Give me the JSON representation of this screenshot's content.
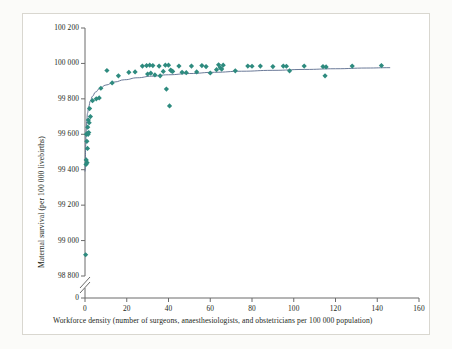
{
  "figure": {
    "background_color": "#fbfbf9",
    "frame_color": "#d9d7d0",
    "plot_background": "#ffffff"
  },
  "chart_data": {
    "type": "scatter",
    "title": "",
    "xlabel": "Workforce density (number of surgeons, anaesthesiologists, and obstetricians per 100 000 population)",
    "ylabel": "Maternal survival (per 100 000 livebirths)",
    "marker_color": "#2e8b7f",
    "curve_color": "#5a6b8c",
    "axis_color": "#6b6b6b",
    "grid": false,
    "legend": null,
    "xlim": [
      0,
      160
    ],
    "ylim": [
      98800,
      100200
    ],
    "y_axis_break": true,
    "y_break_label": "0",
    "xticks": [
      0,
      20,
      40,
      60,
      80,
      100,
      120,
      140,
      160
    ],
    "xticklabels": [
      "0",
      "20",
      "40",
      "60",
      "80",
      "100",
      "120",
      "140",
      "160"
    ],
    "yticks": [
      98800,
      99000,
      99200,
      99400,
      99600,
      99800,
      100000,
      100200
    ],
    "yticklabels": [
      "98 800",
      "99 000",
      "99 200",
      "99 400",
      "99 600",
      "99 800",
      "100 000",
      "100 200"
    ],
    "points": [
      {
        "x": 0.3,
        "y": 98920
      },
      {
        "x": 0.5,
        "y": 99430
      },
      {
        "x": 0.6,
        "y": 99455
      },
      {
        "x": 1.0,
        "y": 99440
      },
      {
        "x": 1.2,
        "y": 99520
      },
      {
        "x": 0.9,
        "y": 99560
      },
      {
        "x": 0.7,
        "y": 99600
      },
      {
        "x": 1.1,
        "y": 99605
      },
      {
        "x": 1.5,
        "y": 99600
      },
      {
        "x": 1.8,
        "y": 99610
      },
      {
        "x": 1.3,
        "y": 99640
      },
      {
        "x": 2.0,
        "y": 99665
      },
      {
        "x": 1.6,
        "y": 99680
      },
      {
        "x": 2.6,
        "y": 99700
      },
      {
        "x": 2.2,
        "y": 99745
      },
      {
        "x": 3.6,
        "y": 99790
      },
      {
        "x": 5.4,
        "y": 99800
      },
      {
        "x": 6.8,
        "y": 99805
      },
      {
        "x": 7.6,
        "y": 99860
      },
      {
        "x": 10.5,
        "y": 99960
      },
      {
        "x": 13.0,
        "y": 99890
      },
      {
        "x": 16.0,
        "y": 99930
      },
      {
        "x": 21.0,
        "y": 99950
      },
      {
        "x": 24.0,
        "y": 99952
      },
      {
        "x": 27.5,
        "y": 99985
      },
      {
        "x": 29.5,
        "y": 99988
      },
      {
        "x": 31.0,
        "y": 99990
      },
      {
        "x": 32.5,
        "y": 99988
      },
      {
        "x": 30.0,
        "y": 99940
      },
      {
        "x": 31.5,
        "y": 99945
      },
      {
        "x": 33.5,
        "y": 99935
      },
      {
        "x": 35.5,
        "y": 99985
      },
      {
        "x": 36.0,
        "y": 99930
      },
      {
        "x": 37.5,
        "y": 99955
      },
      {
        "x": 38.5,
        "y": 99990
      },
      {
        "x": 40.0,
        "y": 99990
      },
      {
        "x": 41.0,
        "y": 99962
      },
      {
        "x": 41.5,
        "y": 99958
      },
      {
        "x": 42.0,
        "y": 99955
      },
      {
        "x": 39.0,
        "y": 99855
      },
      {
        "x": 40.5,
        "y": 99760
      },
      {
        "x": 45.0,
        "y": 99985
      },
      {
        "x": 46.5,
        "y": 99950
      },
      {
        "x": 48.5,
        "y": 99948
      },
      {
        "x": 51.0,
        "y": 99985
      },
      {
        "x": 53.5,
        "y": 99952
      },
      {
        "x": 56.0,
        "y": 99988
      },
      {
        "x": 58.0,
        "y": 99982
      },
      {
        "x": 60.0,
        "y": 99946
      },
      {
        "x": 63.0,
        "y": 99965
      },
      {
        "x": 64.0,
        "y": 99992
      },
      {
        "x": 64.8,
        "y": 99975
      },
      {
        "x": 65.5,
        "y": 99968
      },
      {
        "x": 66.2,
        "y": 99990
      },
      {
        "x": 72.0,
        "y": 99958
      },
      {
        "x": 78.0,
        "y": 99985
      },
      {
        "x": 80.0,
        "y": 99984
      },
      {
        "x": 84.0,
        "y": 99985
      },
      {
        "x": 90.0,
        "y": 99982
      },
      {
        "x": 95.0,
        "y": 99985
      },
      {
        "x": 96.5,
        "y": 99984
      },
      {
        "x": 98.0,
        "y": 99958
      },
      {
        "x": 105.0,
        "y": 99985
      },
      {
        "x": 114.0,
        "y": 99982
      },
      {
        "x": 115.5,
        "y": 99980
      },
      {
        "x": 115.0,
        "y": 99930
      },
      {
        "x": 128.0,
        "y": 99985
      },
      {
        "x": 142.0,
        "y": 99988
      }
    ],
    "fit_curve": {
      "description": "logarithmic fitted trend line",
      "points": [
        {
          "x": 0.15,
          "y": 99390
        },
        {
          "x": 0.3,
          "y": 99530
        },
        {
          "x": 0.5,
          "y": 99610
        },
        {
          "x": 0.8,
          "y": 99672
        },
        {
          "x": 1.2,
          "y": 99718
        },
        {
          "x": 1.8,
          "y": 99758
        },
        {
          "x": 2.6,
          "y": 99790
        },
        {
          "x": 3.6,
          "y": 99815
        },
        {
          "x": 5.0,
          "y": 99838
        },
        {
          "x": 7.0,
          "y": 99858
        },
        {
          "x": 10.0,
          "y": 99878
        },
        {
          "x": 14.0,
          "y": 99895
        },
        {
          "x": 19.0,
          "y": 99908
        },
        {
          "x": 25.0,
          "y": 99919
        },
        {
          "x": 32.0,
          "y": 99928
        },
        {
          "x": 40.0,
          "y": 99936
        },
        {
          "x": 50.0,
          "y": 99943
        },
        {
          "x": 62.0,
          "y": 99950
        },
        {
          "x": 75.0,
          "y": 99956
        },
        {
          "x": 90.0,
          "y": 99961
        },
        {
          "x": 105.0,
          "y": 99966
        },
        {
          "x": 120.0,
          "y": 99970
        },
        {
          "x": 135.0,
          "y": 99974
        },
        {
          "x": 146.0,
          "y": 99976
        }
      ]
    }
  }
}
